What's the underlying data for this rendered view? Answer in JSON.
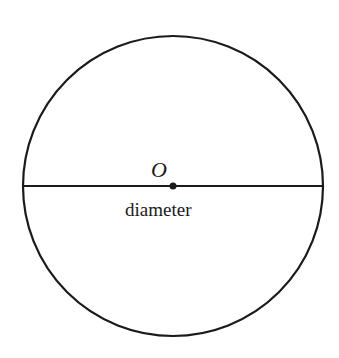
{
  "diagram": {
    "type": "circle-with-diameter",
    "center_label": "O",
    "diameter_label": "diameter",
    "circle": {
      "cx": 173,
      "cy": 186,
      "r": 150
    },
    "colors": {
      "stroke": "#1a1a1a",
      "background": "#ffffff"
    }
  }
}
